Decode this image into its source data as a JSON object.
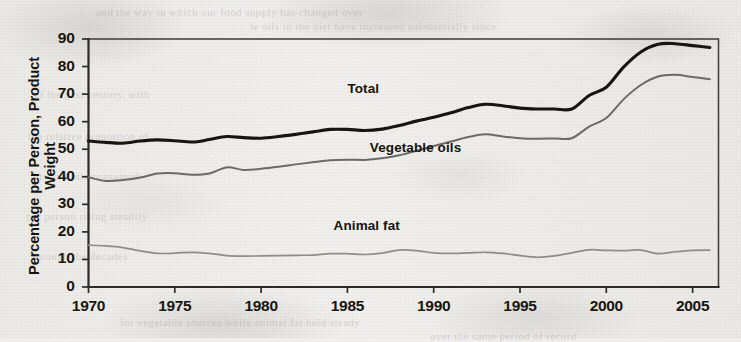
{
  "figure": {
    "background_color": "#efeeec",
    "plot_border_color": "#3a3a38"
  },
  "ghost_marks": [
    {
      "text": "and the way in which our food supply has changed over",
      "x": 96,
      "y": 6
    },
    {
      "text": "le oils in the diet have increased substantially since",
      "x": 250,
      "y": 20
    },
    {
      "text": "of the past century, with",
      "x": 34,
      "y": 88
    },
    {
      "text": "the relative proportion of",
      "x": 28,
      "y": 130
    },
    {
      "text": "fats and oils consumed",
      "x": 30,
      "y": 170
    },
    {
      "text": "per person rising steadily",
      "x": 26,
      "y": 210
    },
    {
      "text": "through the decades",
      "x": 32,
      "y": 250
    },
    {
      "text": "for vegetable sources while animal fat held steady",
      "x": 120,
      "y": 316
    },
    {
      "text": "over the same period of record",
      "x": 430,
      "y": 330
    }
  ],
  "chart_data": {
    "type": "line",
    "title": "",
    "xlabel": "",
    "ylabel": "Percentage per Person, Product Weight",
    "xlim": [
      1970,
      2006.5
    ],
    "ylim": [
      0,
      90
    ],
    "grid": false,
    "legend_position": "inline-annotation",
    "xticks": [
      1970,
      1975,
      1980,
      1985,
      1990,
      1995,
      2000,
      2005
    ],
    "xtick_labels": [
      "1970",
      "1975",
      "1980",
      "1985",
      "1990",
      "1995",
      "2000",
      "2005"
    ],
    "yticks": [
      0,
      10,
      20,
      30,
      40,
      50,
      60,
      70,
      80,
      90
    ],
    "ytick_labels": [
      "0",
      "10",
      "20",
      "30",
      "40",
      "50",
      "60",
      "70",
      "80",
      "90"
    ],
    "x": [
      1970,
      1971,
      1972,
      1973,
      1974,
      1975,
      1976,
      1977,
      1978,
      1979,
      1980,
      1981,
      1982,
      1983,
      1984,
      1985,
      1986,
      1987,
      1988,
      1989,
      1990,
      1991,
      1992,
      1993,
      1994,
      1995,
      1996,
      1997,
      1998,
      1999,
      2000,
      2001,
      2002,
      2003,
      2004,
      2005,
      2006
    ],
    "series": [
      {
        "name": "Total",
        "color": "#16150f",
        "line_width": 3.1,
        "label_x": 1985,
        "label_y": 72,
        "values": [
          53,
          52.5,
          52.2,
          53,
          53.4,
          53.1,
          52.6,
          53.5,
          54.6,
          54.2,
          54,
          54.6,
          55.4,
          56.3,
          57.2,
          57.2,
          56.8,
          57.3,
          58.6,
          60.2,
          61.6,
          63.2,
          65.1,
          66.3,
          65.8,
          64.9,
          64.6,
          64.6,
          64.6,
          69.5,
          72.5,
          79.8,
          85.3,
          88.1,
          88.3,
          87.6,
          86.9
        ]
      },
      {
        "name": "Vegetable oils",
        "color": "#6a6a66",
        "line_width": 2.0,
        "label_x": 1986.3,
        "label_y": 50.5,
        "values": [
          39.8,
          38.5,
          38.8,
          39.7,
          41.2,
          41.3,
          40.7,
          41.2,
          43.4,
          42.5,
          42.9,
          43.6,
          44.5,
          45.3,
          46,
          46.2,
          46.1,
          46.7,
          47.8,
          49.4,
          51.2,
          52.8,
          54.4,
          55.4,
          54.6,
          54,
          53.8,
          53.9,
          54,
          58.2,
          61.3,
          68.1,
          73.3,
          76.4,
          77,
          76.2,
          75.4
        ]
      },
      {
        "name": "Animal fat",
        "color": "#8c8c88",
        "line_width": 1.7,
        "label_x": 1984.2,
        "label_y": 22.2,
        "values": [
          15.2,
          14.9,
          14.3,
          13.1,
          12.2,
          12.3,
          12.6,
          12.2,
          11.4,
          11.2,
          11.3,
          11.4,
          11.5,
          11.6,
          12.1,
          12.1,
          11.8,
          12.3,
          13.4,
          13.2,
          12.4,
          12.2,
          12.4,
          12.6,
          12.2,
          11.4,
          10.8,
          11.3,
          12.4,
          13.5,
          13.3,
          13.2,
          13.4,
          12.1,
          12.8,
          13.3,
          13.4
        ]
      }
    ]
  }
}
